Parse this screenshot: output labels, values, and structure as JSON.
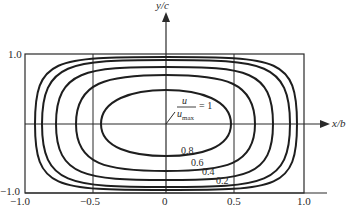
{
  "diagram": {
    "x_axis_label": "x/b",
    "y_axis_label": "y/c",
    "x_ticks": [
      "−1.0",
      "−0.5",
      "0",
      "0.5",
      "1.0"
    ],
    "y_ticks": [
      "1.0",
      "−1.0"
    ],
    "ratio_label": {
      "numerator": "u",
      "denominator": "u",
      "denominator_sub": "max",
      "equals": "= 1"
    },
    "contour_labels": [
      "0.8",
      "0.6",
      "0.4",
      "0.2"
    ],
    "contours": [
      {
        "level": "1",
        "half_width": 0.47,
        "half_height": 0.37
      },
      {
        "level": "0.8",
        "half_width": 0.66,
        "half_height": 0.55
      },
      {
        "level": "0.6",
        "half_width": 0.77,
        "half_height": 0.7
      },
      {
        "level": "0.4",
        "half_width": 0.88,
        "half_height": 0.82
      },
      {
        "level": "0.2",
        "half_width": 0.94,
        "half_height": 0.9
      }
    ],
    "line_color": "#1e1e1e"
  }
}
